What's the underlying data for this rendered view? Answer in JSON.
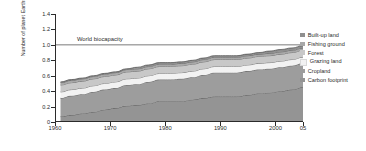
{
  "chart_data": {
    "type": "area",
    "title": "",
    "xlabel": "",
    "ylabel": "Number of planet Earths",
    "xlim": [
      1960,
      2005
    ],
    "ylim": [
      0,
      1.4
    ],
    "grid": false,
    "legend_position": "right",
    "xtick_labels": [
      "1960",
      "1970",
      "1980",
      "1990",
      "2000",
      "05"
    ],
    "xtick_values": [
      1960,
      1970,
      1980,
      1990,
      2000,
      2005
    ],
    "ytick_labels": [
      "0",
      "0.2",
      "0.4",
      "0.6",
      "0.8",
      "1.0",
      "1.2",
      "1.4"
    ],
    "ytick_values": [
      0,
      0.2,
      0.4,
      0.6,
      0.8,
      1.0,
      1.2,
      1.4
    ],
    "annotations": [
      {
        "text": "World biocapacity",
        "y": 1.0,
        "type": "reference-line"
      }
    ],
    "stack_order_bottom_to_top": [
      "Carbon footprint",
      "Cropland",
      "Grazing land",
      "Forest",
      "Fishing ground",
      "Built-up land"
    ],
    "x": [
      1961,
      1963,
      1965,
      1967,
      1969,
      1971,
      1973,
      1975,
      1977,
      1979,
      1981,
      1983,
      1985,
      1987,
      1989,
      1991,
      1993,
      1995,
      1997,
      1999,
      2001,
      2003,
      2005
    ],
    "series": [
      {
        "name": "Carbon footprint",
        "color": "#949494",
        "values": [
          0.07,
          0.09,
          0.11,
          0.13,
          0.16,
          0.18,
          0.21,
          0.22,
          0.24,
          0.27,
          0.27,
          0.27,
          0.29,
          0.31,
          0.33,
          0.33,
          0.33,
          0.35,
          0.37,
          0.38,
          0.4,
          0.42,
          0.45
        ]
      },
      {
        "name": "Cropland",
        "color": "#9d9d9d",
        "values": [
          0.24,
          0.25,
          0.25,
          0.26,
          0.26,
          0.26,
          0.27,
          0.27,
          0.28,
          0.28,
          0.28,
          0.29,
          0.29,
          0.3,
          0.31,
          0.31,
          0.31,
          0.31,
          0.31,
          0.31,
          0.31,
          0.31,
          0.31
        ]
      },
      {
        "name": "Grazing land",
        "color": "#f2f2f2",
        "values": [
          0.08,
          0.08,
          0.08,
          0.08,
          0.08,
          0.08,
          0.08,
          0.08,
          0.08,
          0.08,
          0.08,
          0.08,
          0.08,
          0.08,
          0.08,
          0.08,
          0.08,
          0.08,
          0.08,
          0.08,
          0.08,
          0.08,
          0.08
        ]
      },
      {
        "name": "Forest",
        "color": "#c8c8c8",
        "values": [
          0.09,
          0.09,
          0.09,
          0.09,
          0.09,
          0.09,
          0.09,
          0.09,
          0.09,
          0.09,
          0.09,
          0.09,
          0.09,
          0.09,
          0.09,
          0.09,
          0.09,
          0.09,
          0.09,
          0.09,
          0.09,
          0.09,
          0.09
        ]
      },
      {
        "name": "Fishing ground",
        "color": "#a8a8a8",
        "values": [
          0.03,
          0.03,
          0.03,
          0.03,
          0.03,
          0.03,
          0.03,
          0.03,
          0.03,
          0.03,
          0.03,
          0.03,
          0.03,
          0.03,
          0.03,
          0.03,
          0.03,
          0.03,
          0.03,
          0.03,
          0.03,
          0.03,
          0.03
        ]
      },
      {
        "name": "Built-up land",
        "color": "#8f8f8f",
        "values": [
          0.01,
          0.01,
          0.01,
          0.01,
          0.01,
          0.01,
          0.01,
          0.02,
          0.02,
          0.02,
          0.02,
          0.02,
          0.02,
          0.02,
          0.02,
          0.02,
          0.02,
          0.02,
          0.02,
          0.03,
          0.03,
          0.03,
          0.03
        ]
      }
    ],
    "totals": [
      0.52,
      0.55,
      0.57,
      0.6,
      0.63,
      0.65,
      0.71,
      0.71,
      0.74,
      0.77,
      0.77,
      0.78,
      0.8,
      0.83,
      0.86,
      0.86,
      0.86,
      0.88,
      0.9,
      0.92,
      0.94,
      0.96,
      0.99
    ]
  },
  "legend": {
    "items": [
      {
        "label": "Built-up land",
        "color": "#8f8f8f"
      },
      {
        "label": "Fishing ground",
        "color": "#a8a8a8"
      },
      {
        "label": "Forest",
        "color": "#c8c8c8"
      },
      {
        "label": "Grazing land",
        "color": "#f2f2f2"
      },
      {
        "label": "Cropland",
        "color": "#9d9d9d"
      },
      {
        "label": "Carbon footprint",
        "color": "#949494"
      }
    ]
  }
}
